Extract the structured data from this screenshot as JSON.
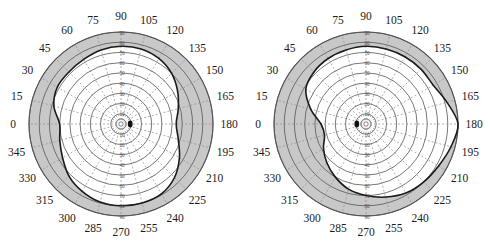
{
  "figure": {
    "background": "#ffffff",
    "watermark_text": "",
    "panel_count": 2
  },
  "style": {
    "grid_solid_color": "#555555",
    "grid_dashed_color": "#8c8c8c",
    "curve_color": "#1a1a1a",
    "band_fill": "#c8c8c8",
    "label_color": "#1a1a1a",
    "radial_label_color": "#4d4d4d",
    "marker_color": "#111111",
    "center_dot_color": "#ffffff"
  },
  "chart_data": [
    {
      "type": "line",
      "subtype": "polar",
      "panel": "left",
      "title": "",
      "xlabel": "",
      "ylabel": "",
      "theta_unit": "degrees",
      "theta_direction": "counterclockwise",
      "theta_zero_location": "W",
      "angle_ticks": [
        0,
        15,
        30,
        45,
        60,
        75,
        90,
        105,
        120,
        135,
        150,
        165,
        180,
        195,
        210,
        225,
        240,
        255,
        270,
        285,
        300,
        315,
        330,
        345
      ],
      "angle_tick_labels": [
        "0",
        "15",
        "30",
        "45",
        "60",
        "75",
        "90",
        "105",
        "120",
        "135",
        "150",
        "165",
        "180",
        "195",
        "210",
        "225",
        "240",
        "255",
        "270",
        "285",
        "300",
        "315",
        "330",
        "345"
      ],
      "radial_ticks": [
        10,
        20,
        30,
        40,
        50,
        60,
        70,
        80,
        90
      ],
      "radial_tick_labels_upper": [
        "10",
        "20",
        "30",
        "40",
        "50",
        "60",
        "70",
        "80",
        "90"
      ],
      "radial_tick_labels_lower": [
        "10",
        "20",
        "30",
        "40",
        "50",
        "60",
        "70",
        "80",
        "90"
      ],
      "rlim": [
        0,
        90
      ],
      "grid": true,
      "legend": false,
      "outer_radius": 90,
      "band_outer_radius": 90,
      "series": [
        {
          "name": "boundary",
          "closed": true,
          "theta": [
            0,
            15,
            30,
            45,
            60,
            75,
            90,
            105,
            120,
            135,
            150,
            165,
            180,
            195,
            210,
            225,
            240,
            255,
            270,
            285,
            300,
            315,
            330,
            345
          ],
          "r": [
            60,
            68,
            72,
            72,
            73,
            75,
            76,
            76,
            74,
            70,
            64,
            58,
            54,
            58,
            66,
            74,
            79,
            80,
            80,
            79,
            76,
            72,
            66,
            62
          ]
        }
      ],
      "marker": {
        "theta": 180,
        "r": 9,
        "label": ""
      },
      "center_dot": {
        "theta": 0,
        "r": 0
      }
    },
    {
      "type": "line",
      "subtype": "polar",
      "panel": "right",
      "title": "",
      "xlabel": "",
      "ylabel": "",
      "theta_unit": "degrees",
      "theta_direction": "counterclockwise",
      "theta_zero_location": "W",
      "angle_ticks": [
        0,
        15,
        30,
        45,
        60,
        75,
        90,
        105,
        120,
        135,
        150,
        165,
        180,
        195,
        210,
        225,
        240,
        255,
        270,
        285,
        300,
        315,
        330,
        345
      ],
      "angle_tick_labels": [
        "0",
        "15",
        "30",
        "45",
        "60",
        "75",
        "90",
        "105",
        "120",
        "135",
        "150",
        "165",
        "180",
        "195",
        "210",
        "225",
        "240",
        "255",
        "270",
        "285",
        "300",
        "315",
        "330",
        "345"
      ],
      "radial_ticks": [
        10,
        20,
        30,
        40,
        50,
        60,
        70,
        80,
        90
      ],
      "radial_tick_labels_upper": [
        "10",
        "20",
        "30",
        "40",
        "50",
        "60",
        "70",
        "80",
        "90"
      ],
      "radial_tick_labels_lower": [
        "10",
        "20",
        "30",
        "40",
        "50",
        "60",
        "70",
        "80",
        "90"
      ],
      "rlim": [
        0,
        90
      ],
      "grid": true,
      "legend": false,
      "outer_radius": 90,
      "band_outer_radius": 90,
      "series": [
        {
          "name": "boundary",
          "closed": true,
          "theta": [
            0,
            15,
            30,
            45,
            60,
            75,
            90,
            105,
            120,
            135,
            150,
            165,
            180,
            195,
            210,
            225,
            240,
            255,
            270,
            285,
            300,
            315,
            330,
            345
          ],
          "r": [
            44,
            56,
            68,
            72,
            74,
            75,
            76,
            76,
            76,
            76,
            76,
            82,
            90,
            86,
            82,
            80,
            78,
            74,
            70,
            66,
            60,
            54,
            48,
            42
          ]
        }
      ],
      "marker": {
        "theta": 0,
        "r": 9,
        "label": ""
      },
      "center_dot": {
        "theta": 0,
        "r": 0
      }
    }
  ]
}
